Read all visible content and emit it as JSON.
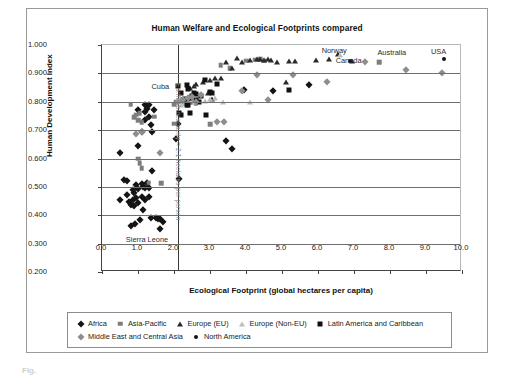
{
  "chart_data": {
    "type": "scatter",
    "title": "Human Welfare and Ecological Footprints compared",
    "xlabel": "Ecological Footprint (global hectares per capita)",
    "ylabel": "Human Development Index",
    "xlim": [
      0.0,
      10.0
    ],
    "ylim": [
      0.2,
      1.0
    ],
    "xticks": [
      "0.0",
      "1.0",
      "2.0",
      "3.0",
      "4.0",
      "5.0",
      "6.0",
      "7.0",
      "8.0",
      "9.0",
      "10.0"
    ],
    "yticks": [
      "0.200",
      "0.300",
      "0.400",
      "0.500",
      "0.600",
      "0.700",
      "0.800",
      "0.900",
      "1.000"
    ],
    "grid": "horizontal",
    "legend_position": "below-axes",
    "annotations": [
      {
        "text": "Earth's biocapacity = 2.1 hectares per person",
        "x": 2.1,
        "y": 0.62,
        "orientation": "vertical"
      },
      {
        "text": "Cuba",
        "x": 1.62,
        "y": 0.857
      },
      {
        "text": "Sierra Leone",
        "x": 1.25,
        "y": 0.315
      },
      {
        "text": "Norway",
        "x": 6.45,
        "y": 0.982
      },
      {
        "text": "Canada",
        "x": 6.85,
        "y": 0.948
      },
      {
        "text": "Australia",
        "x": 8.05,
        "y": 0.975
      },
      {
        "text": "USA",
        "x": 9.35,
        "y": 0.978
      }
    ],
    "reference_lines": [
      {
        "axis": "x",
        "value": 2.1,
        "label": "Earth's biocapacity = 2.1 hectares per person"
      }
    ],
    "series": [
      {
        "name": "Africa",
        "marker": "diamond",
        "color": "#141414",
        "points": [
          [
            0.5,
            0.618
          ],
          [
            0.5,
            0.455
          ],
          [
            0.6,
            0.525
          ],
          [
            0.7,
            0.52
          ],
          [
            0.7,
            0.47
          ],
          [
            0.75,
            0.447
          ],
          [
            0.8,
            0.435
          ],
          [
            0.8,
            0.363
          ],
          [
            0.85,
            0.49
          ],
          [
            0.85,
            0.452
          ],
          [
            0.9,
            0.477
          ],
          [
            0.9,
            0.433
          ],
          [
            0.92,
            0.368
          ],
          [
            0.95,
            0.506
          ],
          [
            0.95,
            0.462
          ],
          [
            1.0,
            0.77
          ],
          [
            1.0,
            0.643
          ],
          [
            1.0,
            0.492
          ],
          [
            1.0,
            0.443
          ],
          [
            1.05,
            0.383
          ],
          [
            1.1,
            0.695
          ],
          [
            1.1,
            0.51
          ],
          [
            1.1,
            0.466
          ],
          [
            1.15,
            0.5
          ],
          [
            1.15,
            0.42
          ],
          [
            1.2,
            0.787
          ],
          [
            1.2,
            0.765
          ],
          [
            1.2,
            0.735
          ],
          [
            1.2,
            0.497
          ],
          [
            1.2,
            0.454
          ],
          [
            1.25,
            0.775
          ],
          [
            1.25,
            0.512
          ],
          [
            1.3,
            0.79
          ],
          [
            1.3,
            0.748
          ],
          [
            1.3,
            0.497
          ],
          [
            1.3,
            0.464
          ],
          [
            1.35,
            0.718
          ],
          [
            1.35,
            0.39
          ],
          [
            1.4,
            0.695
          ],
          [
            1.4,
            0.557
          ],
          [
            1.45,
            0.772
          ],
          [
            1.5,
            0.392
          ],
          [
            1.55,
            0.388
          ],
          [
            1.6,
            0.352
          ],
          [
            1.62,
            0.388
          ],
          [
            1.7,
            0.375
          ],
          [
            2.05,
            0.67
          ],
          [
            2.1,
            0.723
          ],
          [
            2.15,
            0.528
          ],
          [
            3.45,
            0.662
          ],
          [
            3.6,
            0.634
          ],
          [
            3.95,
            0.84
          ],
          [
            4.75,
            0.838
          ],
          [
            5.75,
            0.86
          ]
        ]
      },
      {
        "name": "Asia-Pacific",
        "marker": "square",
        "color": "#7d7d7d",
        "points": [
          [
            0.8,
            0.79
          ],
          [
            0.9,
            0.745
          ],
          [
            0.95,
            0.755
          ],
          [
            1.0,
            0.735
          ],
          [
            1.05,
            0.76
          ],
          [
            1.1,
            0.727
          ],
          [
            1.0,
            0.6
          ],
          [
            1.05,
            0.583
          ],
          [
            1.1,
            0.565
          ],
          [
            1.3,
            0.515
          ],
          [
            1.45,
            0.748
          ],
          [
            1.65,
            0.512
          ],
          [
            2.0,
            0.722
          ],
          [
            2.0,
            0.79
          ],
          [
            2.05,
            0.8
          ],
          [
            2.2,
            0.8
          ],
          [
            2.45,
            0.798
          ],
          [
            2.6,
            0.795
          ],
          [
            3.0,
            0.72
          ],
          [
            3.3,
            0.928
          ],
          [
            3.55,
            0.918
          ],
          [
            4.0,
            0.945
          ],
          [
            4.25,
            0.948
          ],
          [
            4.4,
            0.95
          ],
          [
            4.5,
            0.944
          ],
          [
            7.7,
            0.94
          ],
          [
            2.3,
            0.793
          ]
        ]
      },
      {
        "name": "Europe (EU)",
        "marker": "triangle",
        "color": "#2a2a2a",
        "points": [
          [
            2.45,
            0.848
          ],
          [
            2.55,
            0.855
          ],
          [
            2.6,
            0.862
          ],
          [
            2.8,
            0.87
          ],
          [
            3.0,
            0.878
          ],
          [
            3.15,
            0.885
          ],
          [
            3.3,
            0.885
          ],
          [
            3.45,
            0.94
          ],
          [
            3.6,
            0.918
          ],
          [
            3.75,
            0.955
          ],
          [
            3.9,
            0.94
          ],
          [
            4.1,
            0.948
          ],
          [
            4.3,
            0.95
          ],
          [
            4.4,
            0.952
          ],
          [
            4.5,
            0.948
          ],
          [
            4.6,
            0.95
          ],
          [
            4.7,
            0.946
          ],
          [
            4.85,
            0.94
          ],
          [
            5.2,
            0.945
          ],
          [
            5.35,
            0.945
          ],
          [
            5.95,
            0.948
          ],
          [
            6.3,
            0.95
          ],
          [
            6.55,
            0.968
          ],
          [
            6.95,
            0.945
          ],
          [
            3.05,
            0.81
          ],
          [
            5.1,
            0.868
          ],
          [
            2.95,
            0.83
          ]
        ]
      },
      {
        "name": "Europe (Non-EU)",
        "marker": "triangle",
        "color": "#bdbdbd",
        "points": [
          [
            2.2,
            0.79
          ],
          [
            2.35,
            0.8
          ],
          [
            2.5,
            0.805
          ],
          [
            2.65,
            0.812
          ],
          [
            2.85,
            0.802
          ],
          [
            3.0,
            0.808
          ],
          [
            3.15,
            0.812
          ],
          [
            3.35,
            0.8
          ],
          [
            2.3,
            0.795
          ],
          [
            2.6,
            0.8
          ],
          [
            4.1,
            0.8
          ],
          [
            6.6,
            0.963
          ]
        ]
      },
      {
        "name": "Latin America and Caribbean",
        "marker": "square",
        "color": "#111111",
        "points": [
          [
            2.1,
            0.855
          ],
          [
            2.2,
            0.83
          ],
          [
            2.25,
            0.805
          ],
          [
            2.3,
            0.808
          ],
          [
            2.35,
            0.858
          ],
          [
            2.4,
            0.845
          ],
          [
            2.45,
            0.812
          ],
          [
            2.5,
            0.822
          ],
          [
            2.55,
            0.83
          ],
          [
            2.6,
            0.828
          ],
          [
            2.6,
            0.805
          ],
          [
            2.15,
            0.762
          ],
          [
            2.2,
            0.752
          ],
          [
            2.35,
            0.79
          ],
          [
            2.4,
            0.788
          ],
          [
            2.45,
            0.762
          ],
          [
            2.9,
            0.752
          ],
          [
            2.85,
            0.877
          ],
          [
            3.0,
            0.833
          ],
          [
            3.05,
            0.832
          ],
          [
            3.2,
            0.862
          ],
          [
            2.7,
            0.8
          ],
          [
            2.75,
            0.82
          ],
          [
            5.2,
            0.842
          ]
        ]
      },
      {
        "name": "Middle East and Central Asia",
        "marker": "diamond",
        "color": "#8e8e8e",
        "points": [
          [
            0.95,
            0.688
          ],
          [
            1.1,
            0.695
          ],
          [
            1.6,
            0.62
          ],
          [
            2.1,
            0.8
          ],
          [
            2.25,
            0.805
          ],
          [
            2.4,
            0.812
          ],
          [
            2.5,
            0.818
          ],
          [
            2.6,
            0.8
          ],
          [
            2.75,
            0.823
          ],
          [
            3.2,
            0.727
          ],
          [
            3.4,
            0.73
          ],
          [
            3.9,
            0.838
          ],
          [
            4.3,
            0.895
          ],
          [
            5.3,
            0.895
          ],
          [
            6.25,
            0.868
          ],
          [
            8.45,
            0.912
          ],
          [
            7.3,
            0.94
          ],
          [
            9.45,
            0.902
          ],
          [
            4.6,
            0.805
          ]
        ]
      },
      {
        "name": "North America",
        "marker": "circle",
        "color": "#141414",
        "points": [
          [
            6.9,
            0.943
          ],
          [
            9.5,
            0.95
          ]
        ]
      }
    ]
  },
  "legend": {
    "rows": [
      [
        {
          "label": "Africa",
          "marker": "diamond-dark"
        },
        {
          "label": "Asia-Pacific",
          "marker": "square-gray"
        },
        {
          "label": "Europe (EU)",
          "marker": "triangle-dark"
        },
        {
          "label": "Europe (Non-EU)",
          "marker": "triangle-light"
        },
        {
          "label": "Latin America and Caribbean",
          "marker": "square-dark"
        }
      ],
      [
        {
          "label": "Middle East and Central Asia",
          "marker": "diamond-gray"
        },
        {
          "label": "North America",
          "marker": "circle-dark"
        }
      ]
    ]
  },
  "caption": {
    "text": "Fig."
  }
}
